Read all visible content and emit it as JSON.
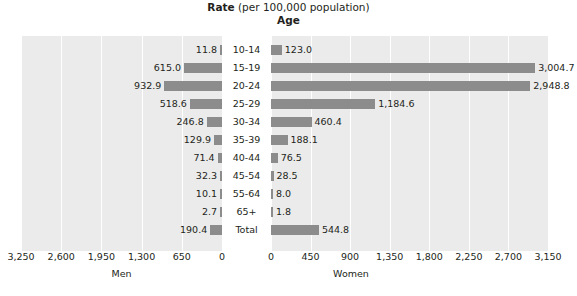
{
  "title": {
    "rate_strong": "Rate",
    "rate_rest": " (per 100,000 population)",
    "age": "Age"
  },
  "axis": {
    "men_name": "Men",
    "women_name": "Women",
    "men_ticks": [
      "3,250",
      "2,600",
      "1,950",
      "1,300",
      "650",
      "0"
    ],
    "women_ticks": [
      "0",
      "450",
      "900",
      "1,350",
      "1,800",
      "2,250",
      "2,700",
      "3,150"
    ]
  },
  "chart_data": {
    "type": "bar",
    "title": "Rate (per 100,000 population)",
    "subtitle": "Age",
    "orientation": "horizontal-diverging",
    "categories": [
      "10-14",
      "15-19",
      "20-24",
      "25-29",
      "30-34",
      "35-39",
      "40-44",
      "45-54",
      "55-64",
      "65+",
      "Total"
    ],
    "xlabel": "Rate (per 100,000 population)",
    "ylabel": "Age",
    "grid": true,
    "legend": "none",
    "bar_color": "#8c8c8c",
    "plot_background": "#ebebeb",
    "series": [
      {
        "name": "Men",
        "axis_side": "left",
        "xlim": [
          0,
          3250
        ],
        "tick_values": [
          3250,
          2600,
          1950,
          1300,
          650,
          0
        ],
        "values": [
          11.8,
          615.0,
          932.9,
          518.6,
          246.8,
          129.9,
          71.4,
          32.3,
          10.1,
          2.7,
          190.4
        ],
        "labels": [
          "11.8",
          "615.0",
          "932.9",
          "518.6",
          "246.8",
          "129.9",
          "71.4",
          "32.3",
          "10.1",
          "2.7",
          "190.4"
        ]
      },
      {
        "name": "Women",
        "axis_side": "right",
        "xlim": [
          0,
          3150
        ],
        "tick_values": [
          0,
          450,
          900,
          1350,
          1800,
          2250,
          2700,
          3150
        ],
        "values": [
          123.0,
          3004.7,
          2948.8,
          1184.6,
          460.4,
          188.1,
          76.5,
          28.5,
          8.0,
          1.8,
          544.8
        ],
        "labels": [
          "123.0",
          "3,004.7",
          "2,948.8",
          "1,184.6",
          "460.4",
          "188.1",
          "76.5",
          "28.5",
          "8.0",
          "1.8",
          "544.8"
        ]
      }
    ]
  }
}
